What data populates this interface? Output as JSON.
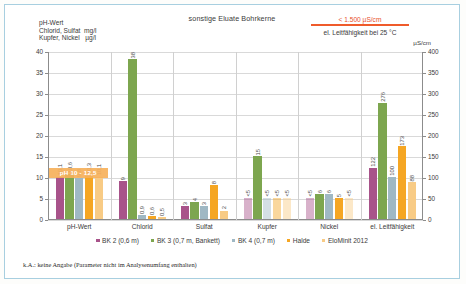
{
  "chart_data": {
    "type": "bar",
    "title": "sonstige Eluate Bohrkerne",
    "left_axis_header": "pH-Wert\nChlorid, Sulfat  mg/l\nKupfer, Nickel   µg/l",
    "right_axis_unit": "µS/cm",
    "right_axis_subtitle": "el. Leitfähigkeit bei 25 °C",
    "annotation": "< 1.500 µS/cm",
    "annotation_color": "#ef5b2b",
    "categories": [
      "pH-Wert",
      "Chlorid",
      "Sulfat",
      "Kupfer",
      "Nickel",
      "el. Leitfähigkeit"
    ],
    "ylabel": "",
    "xlabel": "",
    "ylim": [
      0,
      40
    ],
    "yticks": [
      "0",
      "5",
      "10",
      "15",
      "20",
      "25",
      "30",
      "35",
      "40"
    ],
    "y2lim": [
      0,
      400
    ],
    "y2ticks": [
      "0",
      "50",
      "100",
      "150",
      "200",
      "250",
      "300",
      "350",
      "400"
    ],
    "grid": true,
    "legend_position": "bottom",
    "series": [
      {
        "name": "BK 2 (0,6 m)",
        "color": "#a8538a",
        "values": [
          10.1,
          9,
          3,
          5,
          5,
          122
        ],
        "labels": [
          "10,1",
          "9",
          "3",
          "<5",
          "<5",
          "122"
        ],
        "below_detection": [
          false,
          false,
          false,
          true,
          true,
          false
        ]
      },
      {
        "name": "BK 3 (0,7 m, Bankett)",
        "color": "#7da64f",
        "values": [
          10.6,
          38,
          4,
          15,
          6,
          276
        ],
        "labels": [
          "10,6",
          "38",
          "4",
          "15",
          "6",
          "276"
        ],
        "below_detection": [
          false,
          false,
          false,
          false,
          false,
          false
        ]
      },
      {
        "name": "BK 4 (0,7 m)",
        "color": "#9fb8c4",
        "values": [
          9.8,
          0.9,
          3,
          5,
          6,
          100
        ],
        "labels": [
          "9,8",
          "0,9",
          "3",
          "<5",
          "6",
          "100"
        ],
        "below_detection": [
          false,
          false,
          false,
          true,
          false,
          false
        ]
      },
      {
        "name": "Halde",
        "color": "#f5a623",
        "values": [
          10.3,
          0.6,
          8,
          5,
          5,
          173
        ],
        "labels": [
          "10,3",
          "0,6",
          "8",
          "<5",
          "5",
          "173"
        ],
        "below_detection": [
          false,
          false,
          false,
          true,
          false,
          false
        ]
      },
      {
        "name": "EloMinit 2012",
        "color": "#f8cb85",
        "values": [
          10.1,
          0.5,
          2,
          5,
          5,
          88
        ],
        "labels": [
          "10,1",
          "0,5",
          "2",
          "<5",
          "<5",
          "88"
        ],
        "below_detection": [
          false,
          false,
          false,
          true,
          true,
          false
        ]
      }
    ],
    "band": {
      "label": "pH 10 - 12,5",
      "color": "#f7b15c",
      "from": 10,
      "to": 12.5
    }
  },
  "footnote": "k.A.:  keine Angabe (Parameter nicht im Analysenumfang enthalten)"
}
